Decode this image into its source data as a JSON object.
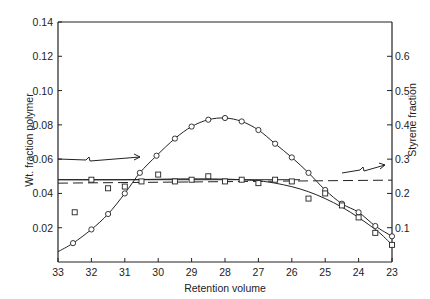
{
  "chart_data": {
    "type": "scatter",
    "title": "",
    "xlabel": "Retention volume",
    "ylabel": "Wt. fraction polymer",
    "y2label": "Styrene fraction",
    "xlim": [
      33,
      23
    ],
    "ylim": [
      0,
      0.14
    ],
    "y2lim": [
      0,
      0.7
    ],
    "x_ticks": [
      "33",
      "32",
      "31",
      "30",
      "29",
      "28",
      "27",
      "26",
      "25",
      "24",
      "23"
    ],
    "y_ticks": [
      "0.02",
      "0.04",
      "0.06",
      "0.08",
      "0.10",
      "0.12",
      "0.14"
    ],
    "y2_ticks": [
      "0.1",
      "0.2",
      "0.3",
      "0.4",
      "0.5",
      "0.6"
    ],
    "grid": false,
    "series": [
      {
        "name": "Wt. fraction polymer",
        "marker": "circle",
        "axis": "left",
        "x": [
          32.55,
          32,
          31.5,
          31,
          30.55,
          30.05,
          29.5,
          29,
          28.5,
          28,
          27.5,
          27,
          26.5,
          26,
          25.5,
          25,
          24.5,
          24,
          23.5,
          23
        ],
        "values": [
          0.011,
          0.019,
          0.028,
          0.04,
          0.052,
          0.062,
          0.072,
          0.079,
          0.083,
          0.084,
          0.082,
          0.077,
          0.069,
          0.061,
          0.052,
          0.042,
          0.034,
          0.029,
          0.021,
          0.015
        ]
      },
      {
        "name": "Styrene fraction",
        "marker": "square",
        "axis": "left-scaled",
        "x": [
          32.5,
          32,
          31.5,
          31,
          30.5,
          30,
          29.5,
          29,
          28.5,
          28,
          27.5,
          27,
          26.5,
          26,
          25.5,
          25,
          24.5,
          24,
          23.5,
          23
        ],
        "values": [
          0.029,
          0.048,
          0.043,
          0.044,
          0.047,
          0.051,
          0.047,
          0.048,
          0.05,
          0.047,
          0.048,
          0.046,
          0.048,
          0.047,
          0.037,
          0.04,
          0.033,
          0.026,
          0.017,
          0.01
        ]
      }
    ],
    "reference_lines": [
      {
        "type": "solid",
        "value_left": 0.048
      },
      {
        "type": "dashed",
        "value_right": 0.23
      }
    ],
    "annotations": [
      {
        "type": "arrow",
        "direction": "left-axis",
        "y_left": 0.06
      },
      {
        "type": "arrow",
        "direction": "right-axis",
        "y_right": 0.28
      }
    ]
  }
}
